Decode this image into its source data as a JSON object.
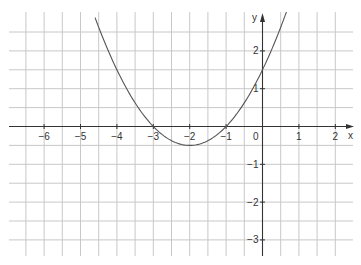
{
  "chart_data": {
    "type": "line",
    "title": "",
    "function_label": "p(x)",
    "xlabel": "x",
    "ylabel": "y",
    "xlim": [
      -7,
      2.5
    ],
    "ylim": [
      -3.5,
      3
    ],
    "grid": true,
    "grid_step": 0.5,
    "x_ticks": [
      -6,
      -5,
      -4,
      -3,
      -2,
      -1,
      1,
      2
    ],
    "x_tick_labels": [
      "−6",
      "−5",
      "−4",
      "−3",
      "−2",
      "−1",
      "1",
      "2"
    ],
    "y_ticks": [
      2,
      1,
      -1,
      -2,
      -3
    ],
    "y_tick_labels": [
      "2",
      "1",
      "−1",
      "−2",
      "−3"
    ],
    "origin_label": "0",
    "series": [
      {
        "name": "p(x)",
        "expression": "0.5x^2 + 2x + 1.5",
        "roots": [
          -3,
          -1
        ],
        "vertex": [
          -2,
          -0.5
        ],
        "y_intercept": 1.5,
        "x": [
          -4.6,
          -4.5,
          -4,
          -3.5,
          -3,
          -2.5,
          -2,
          -1.5,
          -1,
          -0.5,
          0,
          0.5,
          0.8
        ],
        "y": [
          2.88,
          2.625,
          1.5,
          0.625,
          0,
          -0.375,
          -0.5,
          -0.375,
          0,
          0.625,
          1.5,
          2.625,
          3.42
        ]
      }
    ],
    "colors": {
      "grid": "#c8c8c8",
      "axis": "#333333",
      "curve": "#555555"
    }
  }
}
